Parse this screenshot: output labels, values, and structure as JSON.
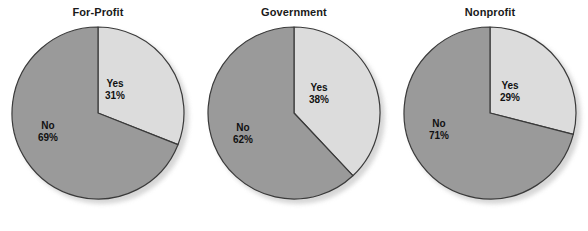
{
  "figure": {
    "background_color": "#ffffff",
    "width": 588,
    "height": 231
  },
  "style": {
    "yes_color": "#dcdcdc",
    "no_color": "#9a9a9a",
    "outline_color": "#3a3a3a",
    "text_color": "#111111",
    "shadow_color": "#c9c9c9"
  },
  "chart_data": [
    {
      "type": "pie",
      "title": "For-Profit",
      "categories": [
        "Yes",
        "No"
      ],
      "values": [
        31,
        69
      ],
      "labels": [
        "31%",
        "69%"
      ],
      "colors": [
        "#dcdcdc",
        "#9a9a9a"
      ],
      "start_angle_deg": 0,
      "direction": "clockwise",
      "units": "percent",
      "legend": "none",
      "grid": false
    },
    {
      "type": "pie",
      "title": "Government",
      "categories": [
        "Yes",
        "No"
      ],
      "values": [
        38,
        62
      ],
      "labels": [
        "38%",
        "62%"
      ],
      "colors": [
        "#dcdcdc",
        "#9a9a9a"
      ],
      "start_angle_deg": 0,
      "direction": "clockwise",
      "units": "percent",
      "legend": "none",
      "grid": false
    },
    {
      "type": "pie",
      "title": "Nonprofit",
      "categories": [
        "Yes",
        "No"
      ],
      "values": [
        29,
        71
      ],
      "labels": [
        "29%",
        "71%"
      ],
      "colors": [
        "#dcdcdc",
        "#9a9a9a"
      ],
      "start_angle_deg": 0,
      "direction": "clockwise",
      "units": "percent",
      "legend": "none",
      "grid": false
    }
  ],
  "panels": [
    {
      "title": "For-Profit",
      "yes_name": "Yes",
      "yes_pct": "31%",
      "no_name": "No",
      "no_pct": "69%"
    },
    {
      "title": "Government",
      "yes_name": "Yes",
      "yes_pct": "38%",
      "no_name": "No",
      "no_pct": "62%"
    },
    {
      "title": "Nonprofit",
      "yes_name": "Yes",
      "yes_pct": "29%",
      "no_name": "No",
      "no_pct": "71%"
    }
  ]
}
